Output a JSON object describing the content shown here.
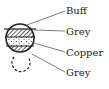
{
  "diagram": {
    "labels": [
      {
        "text": "Buff",
        "band": "top"
      },
      {
        "text": "Grey",
        "band": "upper-hatched"
      },
      {
        "text": "Copper",
        "band": "dotted"
      },
      {
        "text": "Grey",
        "band": "lower-hatched"
      }
    ],
    "colors": {
      "ink": "#222222",
      "background": "#ffffff"
    }
  }
}
